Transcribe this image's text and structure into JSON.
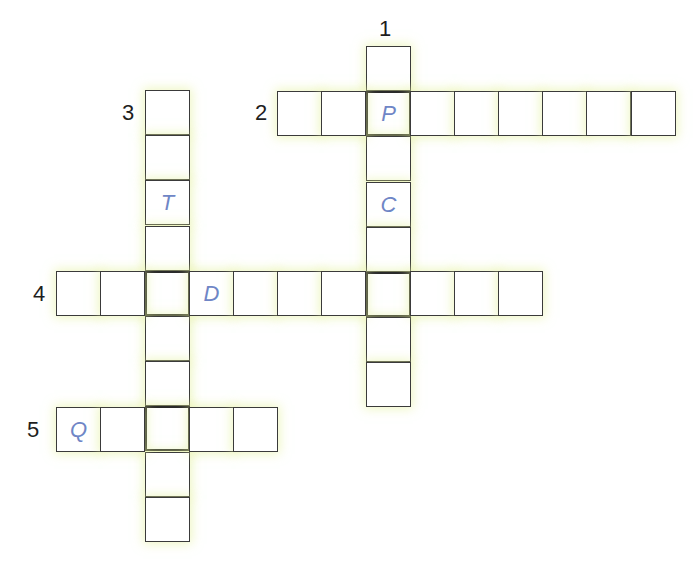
{
  "puzzle": {
    "type": "crossword",
    "cell_size": 45,
    "colors": {
      "border": "#3a3a3a",
      "given_letter": "#6f86c6",
      "number": "#1e1e1e",
      "glow": "#e2f096"
    },
    "clues": [
      {
        "number": "1",
        "direction": "down",
        "length": 8,
        "start": {
          "x": 366,
          "y": 46
        },
        "label_pos": {
          "x": 379,
          "y": 18
        },
        "given": {
          "1": "P",
          "3": "C"
        }
      },
      {
        "number": "2",
        "direction": "across",
        "length": 9,
        "start": {
          "x": 277,
          "y": 91
        },
        "label_pos": {
          "x": 255,
          "y": 102
        },
        "given": {
          "2": "P"
        }
      },
      {
        "number": "3",
        "direction": "down",
        "length": 10,
        "start": {
          "x": 145,
          "y": 90
        },
        "label_pos": {
          "x": 122,
          "y": 102
        },
        "given": {
          "2": "T"
        }
      },
      {
        "number": "4",
        "direction": "across",
        "length": 11,
        "start": {
          "x": 56,
          "y": 271
        },
        "label_pos": {
          "x": 33,
          "y": 283
        },
        "given": {
          "3": "D"
        }
      },
      {
        "number": "5",
        "direction": "across",
        "length": 5,
        "start": {
          "x": 56,
          "y": 407
        },
        "label_pos": {
          "x": 27,
          "y": 419
        },
        "given": {
          "0": "Q"
        }
      }
    ]
  }
}
